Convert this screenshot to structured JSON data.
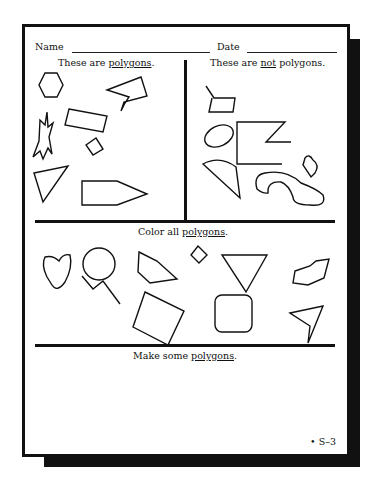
{
  "worksheet": {
    "name_label": "Name",
    "date_label": "Date",
    "section_polygons": {
      "prefix": "These are ",
      "keyword": "polygons",
      "suffix": "."
    },
    "section_not_polygons": {
      "prefix": "These are ",
      "keyword_not": "not",
      "middle": " polygons",
      "suffix": "."
    },
    "section_color": {
      "prefix": "Color all ",
      "keyword": "polygons",
      "suffix": "."
    },
    "section_make": {
      "prefix": "Make some ",
      "keyword": "polygons",
      "suffix": "."
    },
    "page_code": "S–3",
    "page_bullet": "•"
  },
  "shapes": {
    "polygons_examples": [
      "hexagon",
      "jagged-star-polygon",
      "rectangle",
      "lightning-arrow-polygon",
      "small-square",
      "triangle",
      "pencil-pentagon"
    ],
    "not_polygons_examples": [
      "quadrilateral-with-tail",
      "open-z-shape",
      "ellipse",
      "semicircle-wedge",
      "curved-blob",
      "small-curved-blob"
    ],
    "color_shapes": [
      "curved-blob",
      "circle",
      "zigzag-line",
      "quadrilateral",
      "small-diamond",
      "large-square",
      "inverted-triangle",
      "rounded-square",
      "irregular-polygon",
      "arrowhead-polygon"
    ]
  }
}
